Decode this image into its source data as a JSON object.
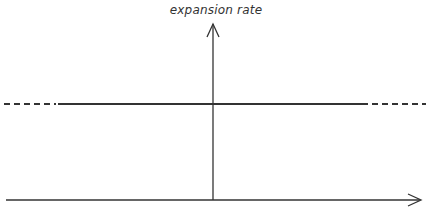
{
  "diagram": {
    "y_axis_label": "expansion rate",
    "x_axis_label": "",
    "line": {
      "description": "constant expansion rate (horizontal line)",
      "y_px": 104,
      "solid_x_range": [
        58,
        368
      ],
      "dashed_left_x_range": [
        4,
        58
      ],
      "dashed_right_x_range": [
        368,
        426
      ]
    },
    "colors": {
      "stroke": "#333333",
      "background": "#ffffff"
    }
  }
}
